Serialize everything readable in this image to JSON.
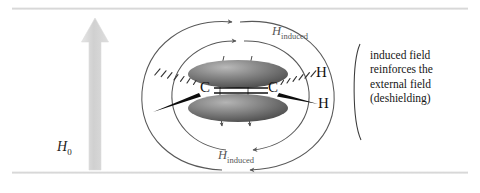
{
  "figure": {
    "external_field_label": "H",
    "external_field_subscript": "0",
    "induced_field_label": "H",
    "induced_field_subscript": "induced",
    "atoms": {
      "carbon_left": "C",
      "carbon_right": "C",
      "hydrogen_upper_right": "H",
      "hydrogen_lower_right": "H"
    },
    "caption_lines": [
      "induced field",
      "reinforces the",
      "external field",
      "(deshielding)"
    ],
    "icons": {
      "external_field_arrow": "up-arrow-icon",
      "induced_field_loop_left": "field-loop-icon",
      "induced_field_loop_right": "field-loop-icon",
      "pi_lobe_top": "orbital-lobe-icon",
      "pi_lobe_bottom": "orbital-lobe-icon",
      "hashed_wedge_bond": "hashed-wedge-icon",
      "solid_wedge_bond": "solid-wedge-icon",
      "double_bond": "double-bond-icon"
    },
    "colors": {
      "external_arrow": "#d2d2d2",
      "field_line": "#585858",
      "orbital_lobe": "#6e6e6e",
      "text": "#161616",
      "rule": "#d8d8d8"
    }
  }
}
